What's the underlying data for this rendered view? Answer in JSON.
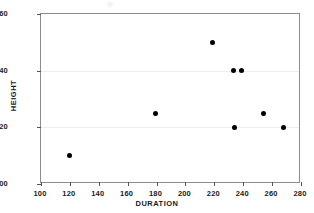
{
  "chart_data": {
    "type": "scatter",
    "title": "",
    "xlabel": "DURATION",
    "ylabel": "HEIGHT",
    "xlim": [
      100,
      280
    ],
    "ylim": [
      100,
      160
    ],
    "xticks": [
      100,
      120,
      140,
      160,
      180,
      200,
      220,
      240,
      260,
      280
    ],
    "yticks": [
      100,
      120,
      140,
      160
    ],
    "grid": "horizontal-faint",
    "legend": "none",
    "marker": {
      "shape": "circle",
      "color": "#000000",
      "size": 5
    },
    "points": [
      {
        "x": 120,
        "y": 110
      },
      {
        "x": 179,
        "y": 125
      },
      {
        "x": 219,
        "y": 150
      },
      {
        "x": 233,
        "y": 140
      },
      {
        "x": 239,
        "y": 140
      },
      {
        "x": 234,
        "y": 120
      },
      {
        "x": 254,
        "y": 125
      },
      {
        "x": 268,
        "y": 120
      }
    ]
  },
  "colors": {
    "background": "#ffffff",
    "axis": "#8d8d8d",
    "tick": "#555555",
    "text": "#1a1a1a",
    "gridline": "#ededed",
    "marker": "#000000"
  },
  "axes": {
    "x_tick_labels": [
      "100",
      "120",
      "140",
      "160",
      "180",
      "200",
      "220",
      "240",
      "260",
      "280"
    ],
    "y_tick_labels": [
      "100",
      "120",
      "140",
      "160"
    ],
    "x_title": "DURATION",
    "y_title": "HEIGHT"
  }
}
